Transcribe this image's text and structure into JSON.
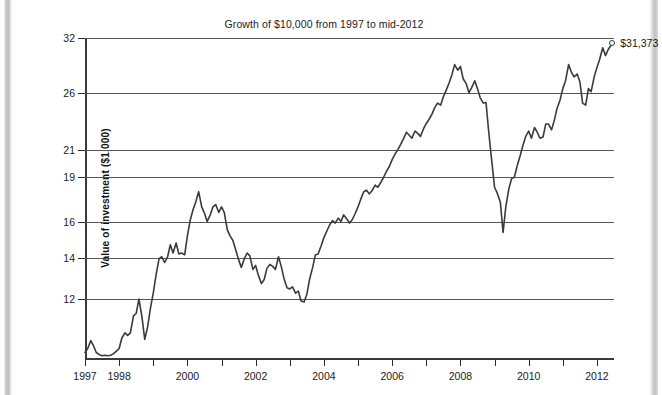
{
  "chart_data": {
    "type": "line",
    "title": "Growth of $10,000 from 1997 to mid-2012",
    "xlabel": "",
    "ylabel": "Value of investment ($1,000)",
    "ytick_labels": [
      "32",
      "26",
      "21",
      "19",
      "16",
      "14",
      "12"
    ],
    "ytick_values": [
      32,
      26,
      21,
      19,
      16,
      14,
      12
    ],
    "yscale": "log",
    "ylim": [
      9.6,
      32
    ],
    "xlim": [
      1997.0,
      2012.5
    ],
    "xtick_labels": [
      "1997",
      "1998",
      "2000",
      "2002",
      "2004",
      "2006",
      "2008",
      "2010",
      "2012"
    ],
    "xtick_values": [
      1997,
      1998,
      2000,
      2002,
      2004,
      2006,
      2008,
      2010,
      2012
    ],
    "xticks_all_years": [
      1997,
      1998,
      1999,
      2000,
      2001,
      2002,
      2003,
      2004,
      2005,
      2006,
      2007,
      2008,
      2009,
      2010,
      2011,
      2012
    ],
    "grid": "horizontal",
    "legend": "none",
    "line_color": "#3a3a3a",
    "grid_color": "#565656",
    "annotation": {
      "label": "$31,373",
      "x": 2012.45,
      "y": 31.373,
      "marker": "open-circle"
    },
    "series": [
      {
        "name": "Value of investment",
        "x": [
          1997.0,
          1997.08,
          1997.17,
          1997.25,
          1997.33,
          1997.42,
          1997.5,
          1997.58,
          1997.67,
          1997.75,
          1997.83,
          1997.92,
          1998.0,
          1998.08,
          1998.17,
          1998.25,
          1998.33,
          1998.42,
          1998.5,
          1998.58,
          1998.67,
          1998.75,
          1998.83,
          1998.92,
          1999.0,
          1999.08,
          1999.17,
          1999.25,
          1999.33,
          1999.42,
          1999.5,
          1999.58,
          1999.67,
          1999.75,
          1999.83,
          1999.92,
          2000.0,
          2000.08,
          2000.17,
          2000.25,
          2000.33,
          2000.42,
          2000.5,
          2000.58,
          2000.67,
          2000.75,
          2000.83,
          2000.92,
          2001.0,
          2001.08,
          2001.17,
          2001.25,
          2001.33,
          2001.42,
          2001.5,
          2001.58,
          2001.67,
          2001.75,
          2001.83,
          2001.92,
          2002.0,
          2002.08,
          2002.17,
          2002.25,
          2002.33,
          2002.42,
          2002.5,
          2002.58,
          2002.67,
          2002.75,
          2002.83,
          2002.92,
          2003.0,
          2003.08,
          2003.17,
          2003.25,
          2003.33,
          2003.42,
          2003.5,
          2003.58,
          2003.67,
          2003.75,
          2003.83,
          2003.92,
          2004.0,
          2004.08,
          2004.17,
          2004.25,
          2004.33,
          2004.42,
          2004.5,
          2004.58,
          2004.67,
          2004.75,
          2004.83,
          2004.92,
          2005.0,
          2005.08,
          2005.17,
          2005.25,
          2005.33,
          2005.42,
          2005.5,
          2005.58,
          2005.67,
          2005.75,
          2005.83,
          2005.92,
          2006.0,
          2006.08,
          2006.17,
          2006.25,
          2006.33,
          2006.42,
          2006.5,
          2006.58,
          2006.67,
          2006.75,
          2006.83,
          2006.92,
          2007.0,
          2007.08,
          2007.17,
          2007.25,
          2007.33,
          2007.42,
          2007.5,
          2007.58,
          2007.67,
          2007.75,
          2007.83,
          2007.92,
          2008.0,
          2008.08,
          2008.17,
          2008.25,
          2008.33,
          2008.42,
          2008.5,
          2008.58,
          2008.67,
          2008.75,
          2008.83,
          2008.92,
          2009.0,
          2009.08,
          2009.17,
          2009.25,
          2009.33,
          2009.42,
          2009.5,
          2009.58,
          2009.67,
          2009.75,
          2009.83,
          2009.92,
          2010.0,
          2010.08,
          2010.17,
          2010.25,
          2010.33,
          2010.42,
          2010.5,
          2010.58,
          2010.67,
          2010.75,
          2010.83,
          2010.92,
          2011.0,
          2011.08,
          2011.17,
          2011.25,
          2011.33,
          2011.42,
          2011.5,
          2011.58,
          2011.67,
          2011.75,
          2011.83,
          2011.92,
          2012.0,
          2012.08,
          2012.17,
          2012.25,
          2012.33,
          2012.45
        ],
        "values": [
          9.8,
          9.95,
          10.25,
          10.05,
          9.8,
          9.72,
          9.68,
          9.7,
          9.68,
          9.7,
          9.75,
          9.85,
          9.95,
          10.35,
          10.55,
          10.45,
          10.55,
          11.25,
          11.35,
          11.98,
          11.2,
          10.3,
          10.75,
          11.6,
          12.25,
          13.1,
          13.95,
          14.05,
          13.75,
          14.05,
          14.7,
          14.25,
          14.8,
          14.2,
          14.25,
          14.15,
          15.2,
          16.1,
          16.8,
          17.3,
          17.95,
          16.95,
          16.55,
          16.05,
          16.45,
          16.95,
          17.1,
          16.6,
          16.95,
          16.6,
          15.55,
          15.2,
          14.95,
          14.4,
          13.9,
          13.5,
          13.95,
          14.25,
          14.1,
          13.4,
          13.6,
          13.1,
          12.7,
          12.9,
          13.45,
          13.65,
          13.55,
          13.4,
          14.05,
          13.55,
          12.95,
          12.5,
          12.45,
          12.55,
          12.25,
          12.35,
          11.9,
          11.85,
          12.2,
          12.9,
          13.5,
          14.15,
          14.2,
          14.65,
          15.1,
          15.45,
          15.85,
          16.1,
          15.95,
          16.25,
          16.05,
          16.45,
          16.2,
          15.95,
          16.15,
          16.55,
          16.95,
          17.45,
          17.95,
          18.05,
          17.8,
          18.05,
          18.4,
          18.25,
          18.6,
          18.95,
          19.35,
          19.75,
          20.25,
          20.65,
          21.05,
          21.45,
          21.9,
          22.45,
          22.2,
          21.95,
          22.55,
          22.35,
          22.1,
          22.75,
          23.2,
          23.55,
          24.05,
          24.65,
          25.05,
          24.85,
          25.65,
          26.25,
          27.05,
          27.85,
          28.95,
          28.35,
          28.75,
          27.45,
          26.95,
          26.05,
          26.55,
          27.25,
          26.45,
          25.55,
          25.05,
          25.1,
          22.45,
          20.1,
          18.25,
          17.85,
          17.25,
          15.4,
          16.95,
          18.15,
          18.85,
          18.95,
          19.85,
          20.55,
          21.35,
          22.15,
          22.55,
          21.95,
          22.85,
          22.45,
          21.95,
          22.05,
          23.15,
          23.15,
          22.65,
          23.45,
          24.55,
          25.35,
          26.45,
          27.25,
          28.95,
          28.15,
          27.65,
          27.95,
          27.15,
          25.05,
          24.85,
          26.45,
          26.15,
          27.65,
          28.65,
          29.55,
          30.85,
          29.95,
          30.65,
          31.373
        ]
      }
    ]
  }
}
